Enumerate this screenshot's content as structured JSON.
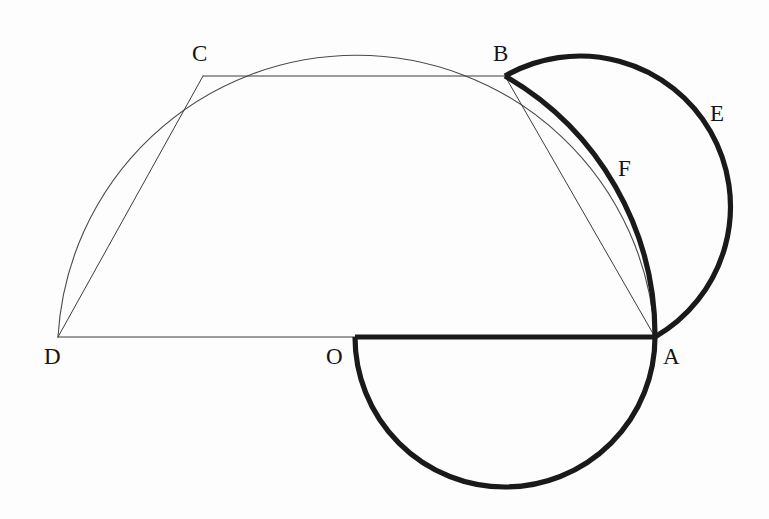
{
  "figure": {
    "type": "geometry-diagram",
    "background_color": "#fdfdfd",
    "thin_stroke_color": "#3c3c3c",
    "bold_stroke_color": "#1a1a1a",
    "canvas": {
      "width": 769,
      "height": 519
    }
  },
  "labels": {
    "A": "A",
    "B": "B",
    "C": "C",
    "D": "D",
    "E": "E",
    "F": "F",
    "O": "O"
  },
  "points": [
    {
      "id": "D",
      "label": "D",
      "x": 58,
      "y": 337,
      "label_x": 44,
      "label_y": 345
    },
    {
      "id": "O",
      "label": "O",
      "x": 355,
      "y": 337,
      "label_x": 326,
      "label_y": 345
    },
    {
      "id": "A",
      "label": "A",
      "x": 655,
      "y": 337,
      "label_x": 663,
      "label_y": 345
    },
    {
      "id": "C",
      "label": "C",
      "x": 203,
      "y": 76,
      "label_x": 192,
      "label_y": 42
    },
    {
      "id": "B",
      "label": "B",
      "x": 505,
      "y": 76,
      "label_x": 493,
      "label_y": 42
    },
    {
      "id": "E",
      "label": "E",
      "x": 718,
      "y": 205,
      "label_x": 710,
      "label_y": 102
    },
    {
      "id": "F",
      "label": "F",
      "x": 610,
      "y": 175,
      "label_x": 618,
      "label_y": 157
    }
  ],
  "segments": [
    {
      "id": "DA",
      "from": "D",
      "to": "A",
      "weight": "thin",
      "path": "M 58 337 L 355 337"
    },
    {
      "id": "OA",
      "from": "O",
      "to": "A",
      "weight": "bold",
      "path": "M 355 337 L 655 337"
    },
    {
      "id": "DC",
      "from": "D",
      "to": "C",
      "weight": "thin",
      "path": "M 58 337 L 203 76"
    },
    {
      "id": "CB",
      "from": "C",
      "to": "B",
      "weight": "thin",
      "path": "M 203 76 L 505 76"
    },
    {
      "id": "BA",
      "from": "B",
      "to": "A",
      "weight": "thin",
      "path": "M 505 76 L 655 337"
    }
  ],
  "arcs": [
    {
      "id": "semicircle-DA",
      "weight": "thin",
      "note": "large semicircle on diameter DA through C and B",
      "path": "M 58 337 A 299 299 0 0 1 655 337"
    },
    {
      "id": "semicircle-OA",
      "weight": "bold",
      "note": "lower semicircle on diameter OA",
      "path": "M 355 337 A 150 150 0 0 0 655 337"
    },
    {
      "id": "arc-E",
      "weight": "bold",
      "note": "outer bold arc from B to A bulging right, labelled E",
      "path": "M 505 76 A 150 150 0 0 1 655 337"
    },
    {
      "id": "arc-F",
      "weight": "bold",
      "note": "inner bold arc from B to A, labelled F",
      "path": "M 505 76 A 299 299 0 0 1 655 337"
    }
  ]
}
